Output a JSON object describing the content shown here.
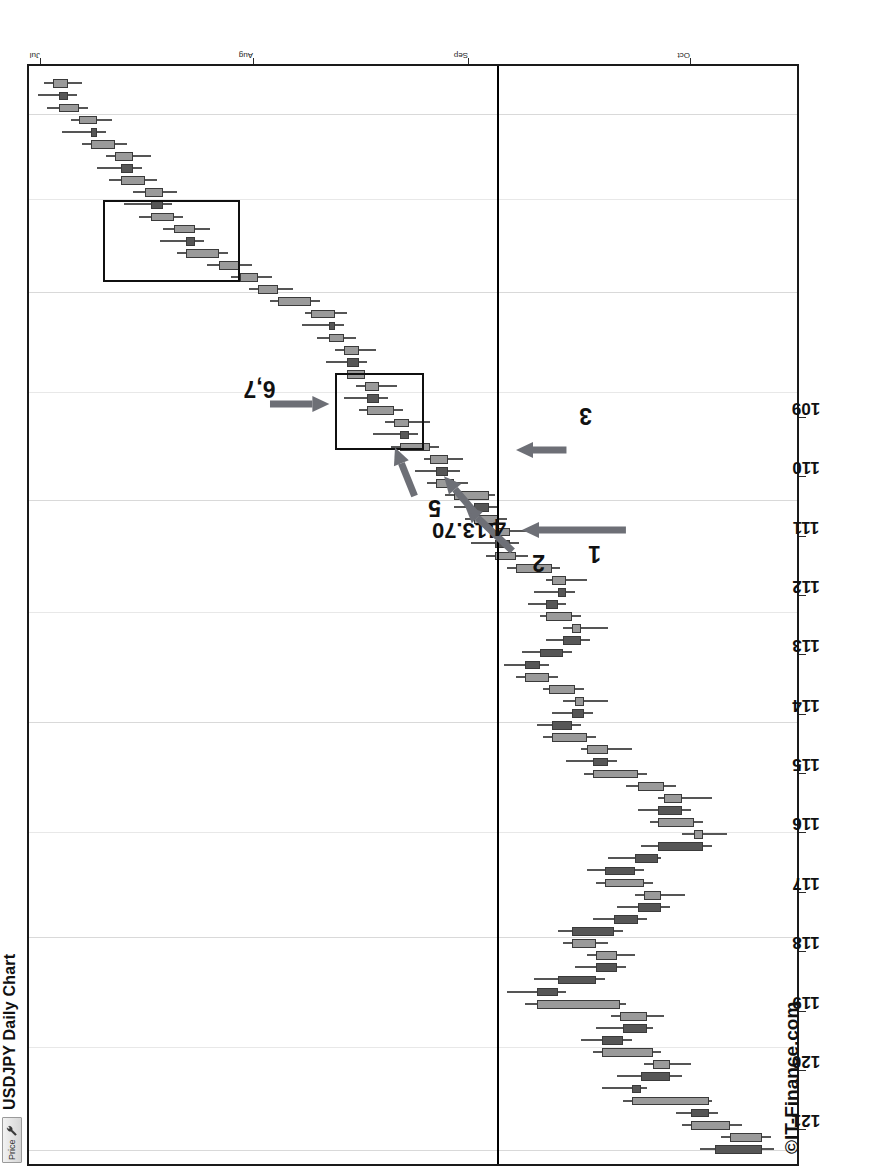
{
  "window": {
    "toolbar": {
      "price_label": "Price",
      "wrench_icon": "wrench-icon"
    },
    "title": "USDJPY Daily Chart",
    "watermark": "©IT-Finance.com"
  },
  "chart_data": {
    "type": "candlestick",
    "title": "USDJPY Daily Chart",
    "xlabel": "",
    "ylabel": "Price",
    "ylim": [
      108.6,
      121.6
    ],
    "yticks": [
      109,
      110,
      111,
      112,
      113,
      114,
      115,
      116,
      117,
      118,
      119,
      120,
      121
    ],
    "ytick_labels": [
      "109",
      "110",
      "111",
      "112",
      "113",
      "114",
      "115",
      "116",
      "117",
      "118",
      "119",
      "120",
      "121"
    ],
    "xticks": [
      "Jul",
      "Aug",
      "Sep",
      "Oct",
      "Nov",
      "Dec"
    ],
    "xtick_positions": [
      0.012,
      0.205,
      0.4,
      0.602,
      0.79,
      0.952
    ],
    "grid": "vertical",
    "legend": "none",
    "colors": {
      "up": "#9a9a9a",
      "down": "#565656",
      "outline": "#3a3a3a",
      "annotation": "#6d6f76",
      "line": "#000000"
    },
    "annotations": [
      {
        "label": "113.70",
        "type": "horizontal-line",
        "value": 113.7
      },
      {
        "label": "1",
        "type": "arrow-up",
        "x": 0.575,
        "y": 113.7
      },
      {
        "label": "2",
        "type": "arrow-up-right",
        "x": 0.6,
        "y": 114.3
      },
      {
        "label": "3",
        "type": "arrow-down",
        "x": 0.648,
        "y": 113.55
      },
      {
        "label": "4",
        "type": "arrow-up-right",
        "x": 0.627,
        "y": 114.6
      },
      {
        "label": "5",
        "type": "arrow-up-right",
        "x": 0.648,
        "y": 115.4
      },
      {
        "label": "6,7",
        "type": "arrow-down",
        "x": 0.69,
        "y": 116.4
      }
    ],
    "zones": [
      {
        "name": "zone-upper",
        "x0": 0.8,
        "x1": 0.875,
        "y0": 118.05,
        "y1": 120.35
      },
      {
        "name": "zone-lower",
        "x0": 0.648,
        "x1": 0.718,
        "y0": 114.95,
        "y1": 116.45
      }
    ],
    "candles": [
      {
        "o": 110.05,
        "h": 110.3,
        "l": 109.05,
        "c": 109.25
      },
      {
        "o": 109.25,
        "h": 109.95,
        "l": 109.1,
        "c": 109.8
      },
      {
        "o": 109.8,
        "h": 110.6,
        "l": 109.6,
        "c": 110.45
      },
      {
        "o": 110.45,
        "h": 110.7,
        "l": 110.0,
        "c": 110.15
      },
      {
        "o": 110.15,
        "h": 111.6,
        "l": 110.1,
        "c": 111.45
      },
      {
        "o": 111.45,
        "h": 111.95,
        "l": 111.2,
        "c": 111.3
      },
      {
        "o": 111.3,
        "h": 111.7,
        "l": 110.6,
        "c": 110.8
      },
      {
        "o": 110.8,
        "h": 111.25,
        "l": 110.45,
        "c": 111.1
      },
      {
        "o": 111.1,
        "h": 112.1,
        "l": 110.95,
        "c": 111.95
      },
      {
        "o": 111.95,
        "h": 112.3,
        "l": 111.45,
        "c": 111.6
      },
      {
        "o": 111.6,
        "h": 112.05,
        "l": 111.1,
        "c": 111.2
      },
      {
        "o": 111.2,
        "h": 111.8,
        "l": 110.9,
        "c": 111.65
      },
      {
        "o": 111.65,
        "h": 113.25,
        "l": 111.55,
        "c": 113.05
      },
      {
        "o": 113.05,
        "h": 113.55,
        "l": 112.55,
        "c": 112.7
      },
      {
        "o": 112.7,
        "h": 113.1,
        "l": 111.9,
        "c": 112.05
      },
      {
        "o": 112.05,
        "h": 112.4,
        "l": 111.55,
        "c": 111.7
      },
      {
        "o": 111.7,
        "h": 112.2,
        "l": 111.4,
        "c": 112.05
      },
      {
        "o": 112.05,
        "h": 112.6,
        "l": 111.85,
        "c": 112.45
      },
      {
        "o": 112.45,
        "h": 112.7,
        "l": 111.6,
        "c": 111.75
      },
      {
        "o": 111.75,
        "h": 112.1,
        "l": 111.2,
        "c": 111.35
      },
      {
        "o": 111.35,
        "h": 111.7,
        "l": 110.8,
        "c": 110.95
      },
      {
        "o": 110.95,
        "h": 111.4,
        "l": 110.55,
        "c": 111.25
      },
      {
        "o": 111.25,
        "h": 112.05,
        "l": 111.1,
        "c": 111.9
      },
      {
        "o": 111.9,
        "h": 112.2,
        "l": 111.25,
        "c": 111.4
      },
      {
        "o": 111.4,
        "h": 111.85,
        "l": 110.95,
        "c": 111.0
      },
      {
        "o": 111.0,
        "h": 111.3,
        "l": 110.1,
        "c": 110.25
      },
      {
        "o": 110.25,
        "h": 110.6,
        "l": 109.85,
        "c": 110.4
      },
      {
        "o": 110.4,
        "h": 111.15,
        "l": 110.25,
        "c": 111.0
      },
      {
        "o": 111.0,
        "h": 111.35,
        "l": 110.45,
        "c": 110.6
      },
      {
        "o": 110.6,
        "h": 111.0,
        "l": 110.1,
        "c": 110.9
      },
      {
        "o": 110.9,
        "h": 111.55,
        "l": 110.7,
        "c": 111.35
      },
      {
        "o": 111.35,
        "h": 112.25,
        "l": 111.2,
        "c": 112.1
      },
      {
        "o": 112.1,
        "h": 112.55,
        "l": 111.7,
        "c": 111.85
      },
      {
        "o": 111.85,
        "h": 112.3,
        "l": 111.45,
        "c": 112.2
      },
      {
        "o": 112.2,
        "h": 112.95,
        "l": 112.05,
        "c": 112.8
      },
      {
        "o": 112.8,
        "h": 113.05,
        "l": 112.3,
        "c": 112.45
      },
      {
        "o": 112.45,
        "h": 112.8,
        "l": 112.1,
        "c": 112.25
      },
      {
        "o": 112.25,
        "h": 112.6,
        "l": 111.85,
        "c": 112.4
      },
      {
        "o": 112.4,
        "h": 112.95,
        "l": 112.25,
        "c": 112.85
      },
      {
        "o": 112.85,
        "h": 113.4,
        "l": 112.7,
        "c": 113.25
      },
      {
        "o": 113.25,
        "h": 113.6,
        "l": 112.85,
        "c": 113.0
      },
      {
        "o": 113.0,
        "h": 113.3,
        "l": 112.45,
        "c": 112.6
      },
      {
        "o": 112.6,
        "h": 112.9,
        "l": 112.15,
        "c": 112.3
      },
      {
        "o": 112.3,
        "h": 112.6,
        "l": 111.85,
        "c": 112.45
      },
      {
        "o": 112.45,
        "h": 113.0,
        "l": 112.3,
        "c": 112.9
      },
      {
        "o": 112.9,
        "h": 113.2,
        "l": 112.55,
        "c": 112.7
      },
      {
        "o": 112.7,
        "h": 113.1,
        "l": 112.4,
        "c": 112.55
      },
      {
        "o": 112.55,
        "h": 112.9,
        "l": 112.2,
        "c": 112.8
      },
      {
        "o": 112.8,
        "h": 113.55,
        "l": 112.65,
        "c": 113.4
      },
      {
        "o": 113.4,
        "h": 113.9,
        "l": 113.2,
        "c": 113.75
      },
      {
        "o": 113.75,
        "h": 114.15,
        "l": 113.35,
        "c": 113.5
      },
      {
        "o": 113.5,
        "h": 113.85,
        "l": 113.1,
        "c": 113.7
      },
      {
        "o": 113.7,
        "h": 114.25,
        "l": 113.55,
        "c": 114.1
      },
      {
        "o": 114.1,
        "h": 114.45,
        "l": 113.7,
        "c": 113.85
      },
      {
        "o": 113.85,
        "h": 114.6,
        "l": 113.75,
        "c": 114.45
      },
      {
        "o": 114.45,
        "h": 114.9,
        "l": 114.2,
        "c": 114.75
      },
      {
        "o": 114.75,
        "h": 115.1,
        "l": 114.35,
        "c": 114.55
      },
      {
        "o": 114.55,
        "h": 114.95,
        "l": 114.3,
        "c": 114.85
      },
      {
        "o": 114.85,
        "h": 115.5,
        "l": 114.7,
        "c": 115.35
      },
      {
        "o": 115.35,
        "h": 115.8,
        "l": 115.05,
        "c": 115.2
      },
      {
        "o": 115.2,
        "h": 115.6,
        "l": 114.85,
        "c": 115.45
      },
      {
        "o": 115.45,
        "h": 116.05,
        "l": 115.3,
        "c": 115.9
      },
      {
        "o": 115.9,
        "h": 116.3,
        "l": 115.55,
        "c": 115.7
      },
      {
        "o": 115.7,
        "h": 116.1,
        "l": 115.4,
        "c": 115.95
      },
      {
        "o": 115.95,
        "h": 116.4,
        "l": 115.8,
        "c": 116.25
      },
      {
        "o": 116.25,
        "h": 116.6,
        "l": 115.9,
        "c": 116.05
      },
      {
        "o": 116.05,
        "h": 116.45,
        "l": 115.75,
        "c": 116.3
      },
      {
        "o": 116.3,
        "h": 116.75,
        "l": 116.1,
        "c": 116.55
      },
      {
        "o": 116.55,
        "h": 117.0,
        "l": 116.3,
        "c": 116.45
      },
      {
        "o": 116.45,
        "h": 116.95,
        "l": 116.25,
        "c": 116.85
      },
      {
        "o": 116.85,
        "h": 117.55,
        "l": 116.7,
        "c": 117.4
      },
      {
        "o": 117.4,
        "h": 117.9,
        "l": 117.15,
        "c": 117.75
      },
      {
        "o": 117.75,
        "h": 118.2,
        "l": 117.5,
        "c": 118.05
      },
      {
        "o": 118.05,
        "h": 118.6,
        "l": 117.85,
        "c": 118.4
      },
      {
        "o": 118.4,
        "h": 119.1,
        "l": 118.25,
        "c": 118.95
      },
      {
        "o": 118.95,
        "h": 119.4,
        "l": 118.65,
        "c": 118.8
      },
      {
        "o": 118.8,
        "h": 119.35,
        "l": 118.55,
        "c": 119.15
      },
      {
        "o": 119.15,
        "h": 119.75,
        "l": 119.0,
        "c": 119.55
      },
      {
        "o": 119.55,
        "h": 120.0,
        "l": 119.2,
        "c": 119.35
      },
      {
        "o": 119.35,
        "h": 119.85,
        "l": 119.1,
        "c": 119.65
      },
      {
        "o": 119.65,
        "h": 120.25,
        "l": 119.45,
        "c": 120.05
      },
      {
        "o": 120.05,
        "h": 120.45,
        "l": 119.7,
        "c": 119.85
      },
      {
        "o": 119.85,
        "h": 120.3,
        "l": 119.55,
        "c": 120.15
      },
      {
        "o": 120.15,
        "h": 120.7,
        "l": 119.95,
        "c": 120.55
      },
      {
        "o": 120.55,
        "h": 121.05,
        "l": 120.3,
        "c": 120.45
      },
      {
        "o": 120.45,
        "h": 120.9,
        "l": 120.2,
        "c": 120.75
      },
      {
        "o": 120.75,
        "h": 121.3,
        "l": 120.6,
        "c": 121.1
      },
      {
        "o": 121.1,
        "h": 121.45,
        "l": 120.8,
        "c": 120.95
      },
      {
        "o": 120.95,
        "h": 121.35,
        "l": 120.7,
        "c": 121.2
      }
    ]
  }
}
